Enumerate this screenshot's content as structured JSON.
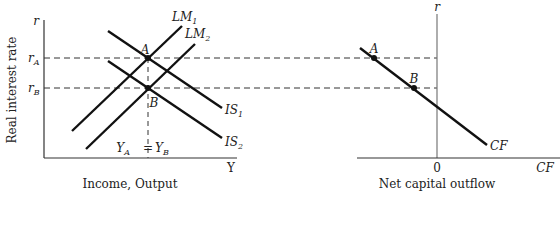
{
  "left_panel": {
    "y_axis_label": "Real interest rate",
    "y_axis_symbol": "r",
    "x_axis_symbol": "Y",
    "x_axis_title": "Income, Output",
    "r_levels": [
      {
        "main": "r",
        "sub": "A"
      },
      {
        "main": "r",
        "sub": "B"
      }
    ],
    "curves": [
      {
        "main": "LM",
        "sub": "1"
      },
      {
        "main": "LM",
        "sub": "2"
      },
      {
        "main": "IS",
        "sub": "1"
      },
      {
        "main": "IS",
        "sub": "2"
      }
    ],
    "points": [
      "A",
      "B"
    ],
    "output_label": {
      "left_main": "Y",
      "left_sub": "A",
      "eq": "=",
      "right_main": "Y",
      "right_sub": "B"
    }
  },
  "right_panel": {
    "y_axis_symbol": "r",
    "x_axis_symbol": "CF",
    "origin_label": "0",
    "x_axis_title": "Net capital outflow",
    "curve_label": "CF",
    "points": [
      "A",
      "B"
    ]
  }
}
